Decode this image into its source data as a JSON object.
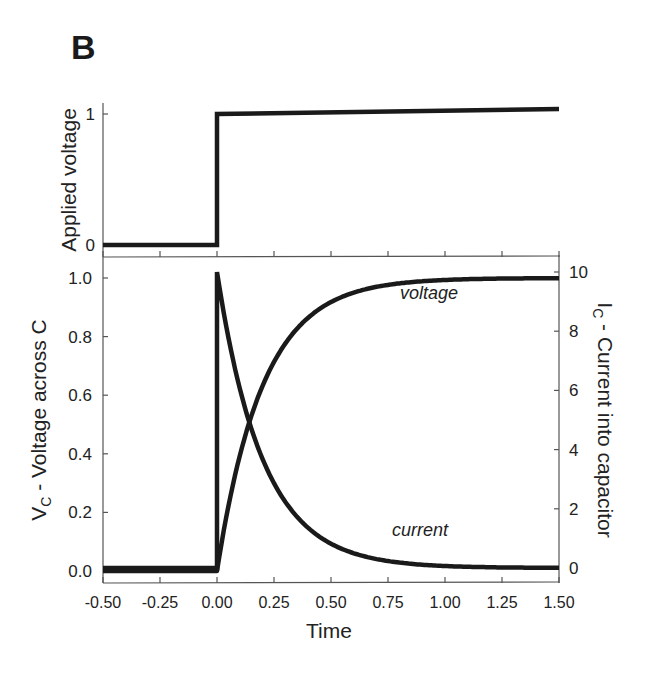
{
  "figure": {
    "panel_label": "B",
    "colors": {
      "line": "#1a1a1a",
      "axis": "#555555",
      "text": "#222222",
      "background": "#ffffff"
    }
  },
  "chart_data": [
    {
      "type": "line",
      "title": "",
      "panel": "top",
      "xlabel": "",
      "ylabel": "Applied voltage",
      "xlim": [
        -0.5,
        1.5
      ],
      "ylim": [
        0,
        1
      ],
      "y_ticks": [
        "0",
        "1"
      ],
      "x_ticks_shown_without_labels": [
        -0.5,
        -0.25,
        0.0,
        0.25,
        0.5,
        0.75,
        1.0,
        1.25,
        1.5
      ],
      "grid": false,
      "series": [
        {
          "name": "applied voltage (step)",
          "x": [
            -0.5,
            0.0,
            0.0,
            1.5
          ],
          "y": [
            0,
            0,
            1,
            1
          ]
        }
      ]
    },
    {
      "type": "line",
      "title": "",
      "panel": "bottom",
      "xlabel": "Time",
      "ylabel": "V_C - Voltage across C",
      "ylabel_right": "I_C - Current into capacitor",
      "xlim": [
        -0.5,
        1.5
      ],
      "ylim": [
        0,
        1.0
      ],
      "ylim_right": [
        0,
        10
      ],
      "x_ticks": [
        "-0.50",
        "-0.25",
        "0.00",
        "0.25",
        "0.50",
        "0.75",
        "1.00",
        "1.25",
        "1.50"
      ],
      "y_ticks": [
        "0.0",
        "0.2",
        "0.4",
        "0.6",
        "0.8",
        "1.0"
      ],
      "y_ticks_right": [
        "0",
        "2",
        "4",
        "6",
        "8",
        "10"
      ],
      "grid": false,
      "annotations": [
        {
          "text": "voltage",
          "x": 0.93,
          "y": 0.93
        },
        {
          "text": "current",
          "x": 0.89,
          "y": 0.12
        }
      ],
      "series": [
        {
          "name": "voltage",
          "axis": "left",
          "x": [
            -0.5,
            0.0,
            0.05,
            0.1,
            0.15,
            0.2,
            0.3,
            0.4,
            0.5,
            0.6,
            0.75,
            1.0,
            1.25,
            1.5
          ],
          "y": [
            0.0,
            0.0,
            0.22,
            0.39,
            0.53,
            0.63,
            0.78,
            0.86,
            0.92,
            0.95,
            0.98,
            0.99,
            1.0,
            1.0
          ]
        },
        {
          "name": "current",
          "axis": "right",
          "x": [
            -0.5,
            0.0,
            0.0,
            0.05,
            0.1,
            0.15,
            0.2,
            0.3,
            0.4,
            0.5,
            0.6,
            0.75,
            1.0,
            1.25,
            1.5
          ],
          "y": [
            0.0,
            0.0,
            10.0,
            7.8,
            6.1,
            4.7,
            3.7,
            2.2,
            1.4,
            0.8,
            0.5,
            0.2,
            0.07,
            0.02,
            0.0
          ]
        }
      ],
      "time_constant_estimate": 0.2
    }
  ]
}
